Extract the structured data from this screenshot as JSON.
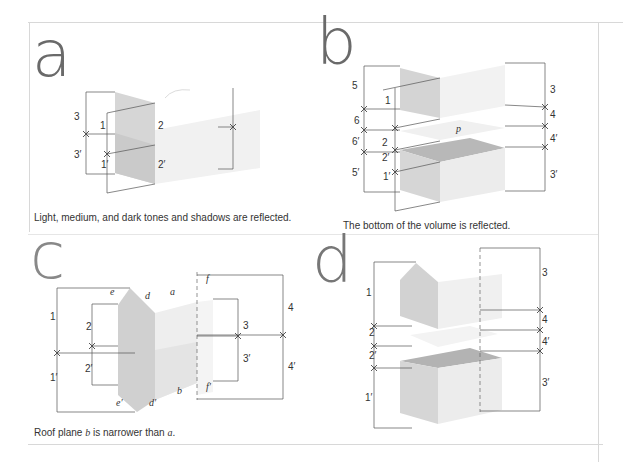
{
  "panels": [
    {
      "letter": "a",
      "caption": "Light, medium, and dark tones and shadows are reflected.",
      "labels": [
        "3",
        "1",
        "2",
        "3′",
        "1′",
        "2′"
      ]
    },
    {
      "letter": "b",
      "caption": "The bottom of the volume is reflected.",
      "labels": [
        "5",
        "1",
        "3",
        "6",
        "4",
        "p",
        "6′",
        "2",
        "4′",
        "2′",
        "5′",
        "1′",
        "3′"
      ]
    },
    {
      "letter": "c",
      "caption_pre": "Roof plane ",
      "caption_b": "b",
      "caption_mid": " is narrower than ",
      "caption_a": "a",
      "caption_end": ".",
      "labels": [
        "e",
        "d",
        "a",
        "f",
        "1",
        "2",
        "4",
        "3",
        "3′",
        "2′",
        "4′",
        "1′",
        "b",
        "f′",
        "e′",
        "d′"
      ]
    },
    {
      "letter": "d",
      "caption": "",
      "labels": [
        "1",
        "3",
        "4",
        "2",
        "4′",
        "2′",
        "1′",
        "3′"
      ]
    }
  ]
}
